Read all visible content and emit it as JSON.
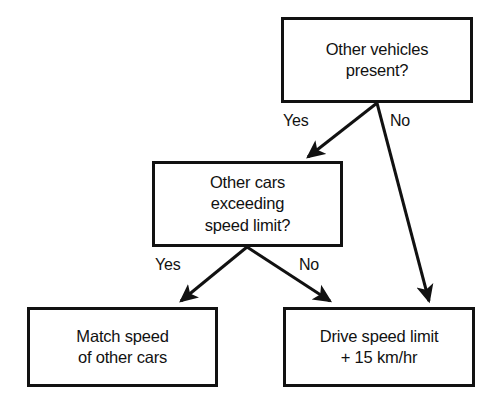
{
  "diagram": {
    "stroke_color": "#111111",
    "background_color": "#ffffff",
    "nodes": [
      {
        "id": "other-vehicles",
        "text": "Other vehicles\npresent?",
        "shape": "rectangle",
        "x": 281,
        "y": 17,
        "width": 192,
        "height": 86
      },
      {
        "id": "other-cars-exceeding",
        "text": "Other cars\nexceeding\nspeed limit?",
        "shape": "rectangle",
        "x": 152,
        "y": 161,
        "width": 191,
        "height": 86
      },
      {
        "id": "match-speed",
        "text": "Match speed\nof other cars",
        "shape": "rectangle",
        "x": 27,
        "y": 307,
        "width": 191,
        "height": 80
      },
      {
        "id": "drive-speed-limit",
        "text": "Drive speed limit\n+ 15 km/hr",
        "shape": "rectangle",
        "x": 283,
        "y": 307,
        "width": 192,
        "height": 80
      }
    ],
    "edges": [
      {
        "id": "top-yes",
        "label": "Yes",
        "from": "other-vehicles",
        "to": "other-cars-exceeding",
        "label_x": 283,
        "label_y": 112
      },
      {
        "id": "top-no",
        "label": "No",
        "from": "other-vehicles",
        "to": "drive-speed-limit",
        "label_x": 390,
        "label_y": 112
      },
      {
        "id": "mid-yes",
        "label": "Yes",
        "from": "other-cars-exceeding",
        "to": "match-speed",
        "label_x": 155,
        "label_y": 256
      },
      {
        "id": "mid-no",
        "label": "No",
        "from": "other-cars-exceeding",
        "to": "drive-speed-limit",
        "label_x": 299,
        "label_y": 256
      }
    ]
  }
}
